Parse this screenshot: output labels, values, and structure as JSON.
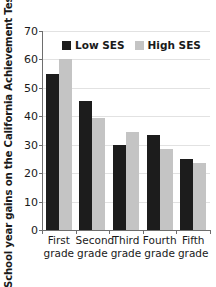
{
  "chart_data": {
    "type": "bar",
    "title": "",
    "xlabel": "",
    "ylabel": "School year gains on the California Achievement Test",
    "ylim": [
      0,
      70
    ],
    "yticks": [
      0,
      10,
      20,
      30,
      40,
      50,
      60,
      70
    ],
    "ytick_labels": [
      "0",
      "10",
      "20",
      "30",
      "40",
      "50",
      "60",
      "70"
    ],
    "grid": true,
    "legend_position": "top-center",
    "categories": [
      "First grade",
      "Second grade",
      "Third grade",
      "Fourth grade",
      "Fifth grade"
    ],
    "category_lines": [
      [
        "First",
        "grade"
      ],
      [
        "Second",
        "grade"
      ],
      [
        "Third",
        "grade"
      ],
      [
        "Fourth",
        "grade"
      ],
      [
        "Fifth",
        "grade"
      ]
    ],
    "series": [
      {
        "name": "Low SES",
        "color": "#1c1c1c",
        "values": [
          55,
          45.5,
          30,
          33.5,
          25
        ]
      },
      {
        "name": "High SES",
        "color": "#c4c4c4",
        "values": [
          60,
          39.5,
          34.5,
          28.5,
          23.5
        ]
      }
    ]
  },
  "axis": {
    "y_title": "School year gains on the California Achievement Test"
  },
  "legend": {
    "items": [
      {
        "label": "Low SES",
        "color": "#1c1c1c"
      },
      {
        "label": "High SES",
        "color": "#c4c4c4"
      }
    ]
  }
}
